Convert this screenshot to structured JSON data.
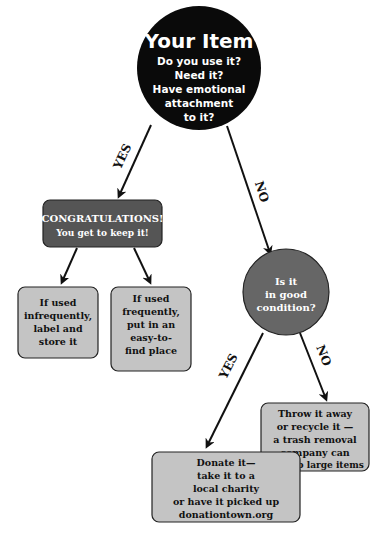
{
  "diagram": {
    "type": "decision-flowchart",
    "colors": {
      "start_node": "#0a0a0a",
      "keep_node": "#555555",
      "condition_node": "#666666",
      "leaf_box": "#c4c4c4",
      "stroke": "#111111",
      "arrow": "#111111",
      "light_text": "#ffffff",
      "dark_text": "#111111"
    },
    "start": {
      "title": "Your Item",
      "lines": [
        "Do you use it?",
        "Need it?",
        "Have emotional",
        "attachment",
        "to it?"
      ]
    },
    "edges": {
      "start_yes": "YES",
      "start_no": "NO",
      "condition_yes": "YES",
      "condition_no": "NO"
    },
    "keep": {
      "title": "CONGRATULATIONS!",
      "subtitle": "You get to keep it!"
    },
    "keep_left": {
      "lines": [
        "If used",
        "infrequently,",
        "label and",
        "store it"
      ]
    },
    "keep_right": {
      "lines": [
        "If used",
        "frequently,",
        "put in an",
        "easy-to-",
        "find place"
      ]
    },
    "condition": {
      "lines": [
        "Is it",
        "in good",
        "condition?"
      ]
    },
    "discard": {
      "lines": [
        "Throw it away",
        "or recycle it —",
        "a trash removal",
        "company can",
        "pick up large items"
      ]
    },
    "donate": {
      "lines": [
        "Donate it—",
        "take it to a",
        "local charity",
        "or have it picked up",
        "donationtown.org"
      ]
    }
  }
}
